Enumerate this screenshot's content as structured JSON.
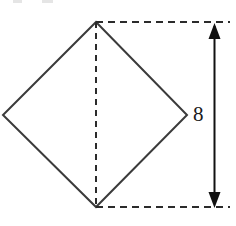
{
  "figure": {
    "background_color": "#ffffff",
    "stroke_color": "#3b3b3b",
    "dash_color": "#2b2b2b",
    "arrow_color": "#111111",
    "label_color": "#1a1a1a",
    "shape": {
      "name": "square-diamond",
      "fill": "none",
      "vertices": {
        "top": {
          "x": 96,
          "y": 22
        },
        "right": {
          "x": 187,
          "y": 115
        },
        "bottom": {
          "x": 96,
          "y": 207
        },
        "left": {
          "x": 3,
          "y": 115
        }
      }
    },
    "diagonal_dashed": {
      "name": "vertical-diagonal",
      "x1": 96,
      "y1": 22,
      "x2": 96,
      "y2": 207
    },
    "extension_lines": [
      {
        "name": "top-extension-line",
        "x1": 96,
        "y1": 22,
        "x2": 230,
        "y2": 22
      },
      {
        "name": "bottom-extension-line",
        "x1": 96,
        "y1": 207,
        "x2": 230,
        "y2": 207
      }
    ],
    "dimension": {
      "name": "height-dimension",
      "value": "8",
      "orientation": "vertical",
      "x": 214,
      "y_top": 23,
      "y_bottom": 208,
      "label_x": 193,
      "label_y": 104
    }
  },
  "artifacts": [
    {
      "name": "crop-artifact-left",
      "x": 13,
      "y": 0,
      "w": 9,
      "h": 3
    },
    {
      "name": "crop-artifact-right",
      "x": 42,
      "y": 0,
      "w": 11,
      "h": 3
    }
  ]
}
